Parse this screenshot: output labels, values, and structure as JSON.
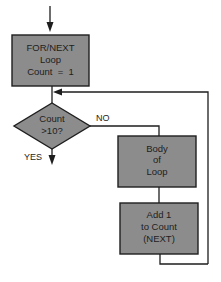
{
  "diagram": {
    "type": "flowchart",
    "colors": {
      "node_fill": "#8c8c8c",
      "node_stroke": "#1e1e1e",
      "line": "#1e1e1e",
      "background": "#ffffff"
    },
    "nodes": {
      "init": {
        "shape": "rectangle",
        "lines": [
          "FOR/NEXT",
          "Loop",
          "Count  =  1"
        ]
      },
      "decision": {
        "shape": "diamond",
        "lines": [
          "Count",
          ">10?"
        ]
      },
      "body": {
        "shape": "rectangle",
        "lines": [
          "Body",
          "of",
          "Loop"
        ]
      },
      "increment": {
        "shape": "rectangle",
        "lines": [
          "Add 1",
          "to Count",
          "(NEXT)"
        ]
      }
    },
    "edge_labels": {
      "no": "NO",
      "yes": "YES"
    },
    "edges": [
      {
        "from": "entry",
        "to": "init"
      },
      {
        "from": "init",
        "to": "decision"
      },
      {
        "from": "decision",
        "to": "body",
        "label": "NO"
      },
      {
        "from": "decision",
        "to": "exit",
        "label": "YES"
      },
      {
        "from": "body",
        "to": "increment"
      },
      {
        "from": "increment",
        "to": "decision",
        "note": "loop back"
      }
    ]
  }
}
